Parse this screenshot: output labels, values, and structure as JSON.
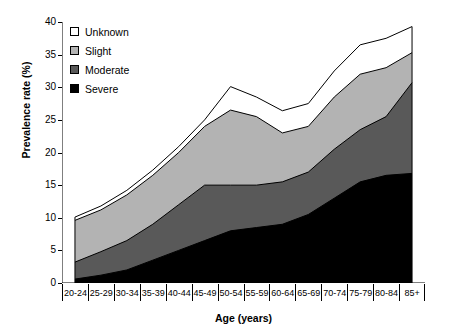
{
  "chart_data": {
    "type": "area",
    "stacked": true,
    "title": "",
    "xlabel": "Age (years)",
    "ylabel": "Prevalence rate (%)",
    "ylim": [
      0,
      40
    ],
    "yticks": [
      0,
      5,
      10,
      15,
      20,
      25,
      30,
      35,
      40
    ],
    "grid": false,
    "legend_position": "top-left",
    "categories": [
      "20-24",
      "25-29",
      "30-34",
      "35-39",
      "40-44",
      "45-49",
      "50-54",
      "55-59",
      "60-64",
      "65-69",
      "70-74",
      "75-79",
      "80-84",
      "85+"
    ],
    "series": [
      {
        "name": "Severe",
        "color": "#000000",
        "values": [
          0.6,
          1.2,
          2.0,
          3.5,
          5.0,
          6.5,
          8.0,
          8.5,
          9.0,
          10.5,
          13.0,
          15.5,
          16.5,
          16.8
        ]
      },
      {
        "name": "Moderate",
        "color": "#595959",
        "values": [
          2.6,
          3.6,
          4.5,
          5.5,
          7.0,
          8.5,
          7.0,
          6.5,
          6.5,
          6.5,
          7.5,
          8.0,
          9.0,
          13.9
        ]
      },
      {
        "name": "Slight",
        "color": "#b3b3b3",
        "values": [
          6.4,
          6.4,
          7.0,
          7.5,
          8.0,
          9.0,
          11.5,
          10.5,
          7.5,
          7.0,
          8.0,
          8.5,
          7.5,
          4.6
        ]
      },
      {
        "name": "Unknown",
        "color": "#ffffff",
        "values": [
          0.5,
          0.6,
          0.7,
          0.8,
          0.9,
          1.0,
          3.6,
          3.0,
          3.4,
          3.5,
          4.0,
          4.5,
          4.5,
          4.0
        ]
      }
    ],
    "cumulative_tops": {
      "severe": [
        0.6,
        1.2,
        2.0,
        3.5,
        5.0,
        6.5,
        8.0,
        8.5,
        9.0,
        10.5,
        13.0,
        15.5,
        16.5,
        16.8
      ],
      "moderate": [
        3.2,
        4.8,
        6.5,
        9.0,
        12.0,
        15.0,
        15.0,
        15.0,
        15.5,
        17.0,
        20.5,
        23.5,
        25.5,
        30.7
      ],
      "slight": [
        9.6,
        11.2,
        13.5,
        16.5,
        20.0,
        24.0,
        26.5,
        25.5,
        23.0,
        24.0,
        28.5,
        32.0,
        33.0,
        35.3
      ],
      "total": [
        10.1,
        11.8,
        14.2,
        17.3,
        20.9,
        25.0,
        30.1,
        28.5,
        26.4,
        27.5,
        32.5,
        36.5,
        37.5,
        39.3
      ]
    },
    "legend_entries": [
      {
        "label": "Unknown",
        "color": "#ffffff"
      },
      {
        "label": "Slight",
        "color": "#b3b3b3"
      },
      {
        "label": "Moderate",
        "color": "#595959"
      },
      {
        "label": "Severe",
        "color": "#000000"
      }
    ]
  }
}
